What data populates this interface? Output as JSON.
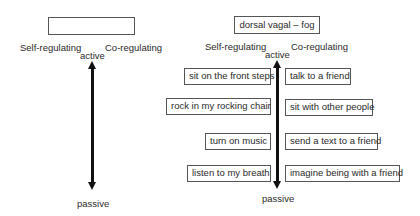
{
  "left_panel": {
    "title": "",
    "self_label": "Self-regulating",
    "co_label": "Co-regulating",
    "top_label": "active",
    "bottom_label": "passive"
  },
  "right_panel": {
    "title": "dorsal vagal – fog",
    "self_label": "Self-regulating",
    "co_label": "Co-regulating",
    "top_label": "active",
    "bottom_label": "passive",
    "self_items": [
      "sit on the front steps",
      "rock in my rocking chair",
      "turn on music",
      "listen to my breath"
    ],
    "co_items": [
      "talk to a friend",
      "sit with other people",
      "send a text to a friend",
      "imagine being with a friend"
    ]
  }
}
